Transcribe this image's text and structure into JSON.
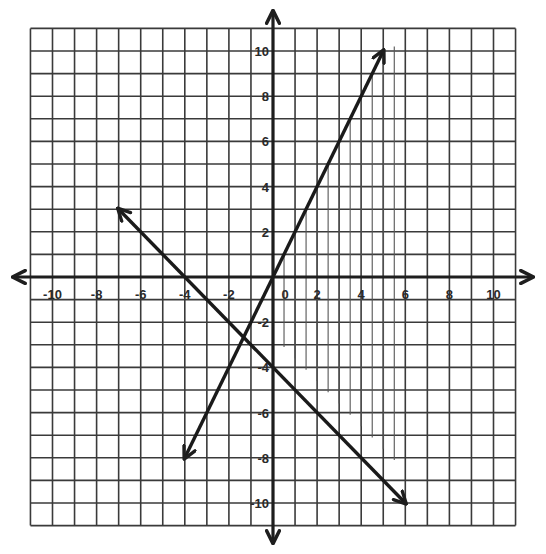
{
  "graph": {
    "x_range": [
      -11,
      11
    ],
    "y_range": [
      -11,
      11
    ],
    "x_tick_labels": [
      "-10",
      "-8",
      "-6",
      "-4",
      "-2",
      "0",
      "2",
      "4",
      "6",
      "8",
      "10"
    ],
    "y_tick_labels": [
      "10",
      "8",
      "6",
      "4",
      "2",
      "-2",
      "-4",
      "-6",
      "-8",
      "-10"
    ],
    "grid_color": "#3a3a3a",
    "axis_color": "#1e1e1e"
  },
  "chart_data": {
    "type": "line",
    "title": "",
    "xlabel": "",
    "ylabel": "",
    "xlim": [
      -11,
      11
    ],
    "ylim": [
      -11,
      11
    ],
    "grid": true,
    "series": [
      {
        "name": "line-1",
        "equation": "y = 2x",
        "points": [
          [
            -4,
            -8
          ],
          [
            5,
            10
          ]
        ],
        "arrows": "both"
      },
      {
        "name": "line-2",
        "equation": "y = -x - 4",
        "points": [
          [
            -7,
            3
          ],
          [
            6,
            -10
          ]
        ],
        "arrows": "both"
      }
    ],
    "shading": {
      "style": "vertical-hatch",
      "x_positions": [
        0.5,
        1,
        1.5,
        2,
        2.5,
        3,
        3.5,
        4,
        4.5,
        5,
        5.5
      ],
      "description": "hatched region right of y = 2x, above y = -x - 4"
    },
    "intersection": [
      -1.33,
      -2.67
    ]
  }
}
